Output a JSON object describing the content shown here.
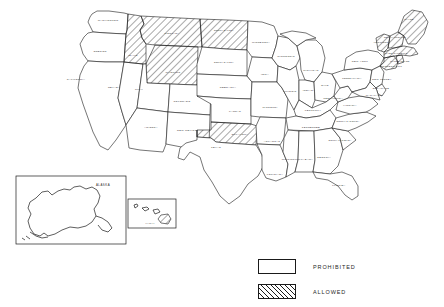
{
  "document": {
    "type": "choropleth-map",
    "region": "United States",
    "rendering": "black-and-white line drawing"
  },
  "legend": {
    "items": [
      {
        "label": "PROHIBITED",
        "pattern": "solid-white",
        "swatch": "prohibited-swatch"
      },
      {
        "label": "ALLOWED",
        "pattern": "diagonal-hatch",
        "swatch": "allowed-swatch"
      }
    ]
  },
  "insets": [
    {
      "name": "ALASKA",
      "label": "ALASKA",
      "status": "prohibited"
    },
    {
      "name": "HAWAII",
      "label": "HAWAII",
      "status": "allowed"
    }
  ],
  "colors": {
    "ink": "#1a1a1a",
    "paper": "#ffffff",
    "label_text": "#2b2b2b"
  },
  "map_data": {
    "type": "choropleth",
    "categories": [
      "PROHIBITED",
      "ALLOWED"
    ],
    "allowed_states": [
      "IDAHO",
      "MONTANA",
      "WYOMING",
      "NORTH DAKOTA",
      "OKLAHOMA",
      "MAINE",
      "NEW HAMPSHIRE",
      "VERMONT",
      "MASSACHUSETTS",
      "CONNECTICUT",
      "RHODE ISLAND",
      "HAWAII"
    ],
    "states": [
      {
        "label": "WASHINGTON",
        "status": "prohibited",
        "lx": 108,
        "ly": 21
      },
      {
        "label": "OREGON",
        "status": "prohibited",
        "lx": 100,
        "ly": 52
      },
      {
        "label": "CALIFORNIA",
        "status": "prohibited",
        "lx": 76,
        "ly": 80
      },
      {
        "label": "NEVADA",
        "status": "prohibited",
        "lx": 114,
        "ly": 88
      },
      {
        "label": "IDAHO",
        "status": "allowed",
        "lx": 133,
        "ly": 56
      },
      {
        "label": "MONTANA",
        "status": "allowed",
        "lx": 172,
        "ly": 34
      },
      {
        "label": "WYOMING",
        "status": "allowed",
        "lx": 173,
        "ly": 73
      },
      {
        "label": "UTAH",
        "status": "prohibited",
        "lx": 139,
        "ly": 90
      },
      {
        "label": "ARIZONA",
        "status": "prohibited",
        "lx": 151,
        "ly": 128
      },
      {
        "label": "COLORADO",
        "status": "prohibited",
        "lx": 182,
        "ly": 102
      },
      {
        "label": "NEW MEXICO",
        "status": "prohibited",
        "lx": 187,
        "ly": 131
      },
      {
        "label": "NORTH DAKOTA",
        "status": "allowed",
        "lx": 224,
        "ly": 31
      },
      {
        "label": "SOUTH DAKOTA",
        "status": "prohibited",
        "lx": 224,
        "ly": 63
      },
      {
        "label": "NEBRASKA",
        "status": "prohibited",
        "lx": 228,
        "ly": 88
      },
      {
        "label": "KANSAS",
        "status": "prohibited",
        "lx": 235,
        "ly": 112
      },
      {
        "label": "OKLAHOMA",
        "status": "allowed",
        "lx": 240,
        "ly": 135
      },
      {
        "label": "TEXAS",
        "status": "prohibited",
        "lx": 216,
        "ly": 148
      },
      {
        "label": "MINNESOTA",
        "status": "prohibited",
        "lx": 261,
        "ly": 43
      },
      {
        "label": "IOWA",
        "status": "prohibited",
        "lx": 265,
        "ly": 75
      },
      {
        "label": "MISSOURI",
        "status": "prohibited",
        "lx": 270,
        "ly": 108
      },
      {
        "label": "ARKANSAS",
        "status": "prohibited",
        "lx": 272,
        "ly": 142
      },
      {
        "label": "LOUISIANA",
        "status": "prohibited",
        "lx": 275,
        "ly": 175
      },
      {
        "label": "WISCONSIN",
        "status": "prohibited",
        "lx": 286,
        "ly": 57
      },
      {
        "label": "ILLINOIS",
        "status": "prohibited",
        "lx": 290,
        "ly": 92
      },
      {
        "label": "MICHIGAN",
        "status": "prohibited",
        "lx": 311,
        "ly": 71
      },
      {
        "label": "INDIANA",
        "status": "prohibited",
        "lx": 309,
        "ly": 91
      },
      {
        "label": "OHIO",
        "status": "prohibited",
        "lx": 325,
        "ly": 86
      },
      {
        "label": "KENTUCKY",
        "status": "prohibited",
        "lx": 313,
        "ly": 111
      },
      {
        "label": "TENNESSEE",
        "status": "prohibited",
        "lx": 311,
        "ly": 128
      },
      {
        "label": "MISSISSIPPI",
        "status": "prohibited",
        "lx": 291,
        "ly": 160
      },
      {
        "label": "ALABAMA",
        "status": "prohibited",
        "lx": 306,
        "ly": 160
      },
      {
        "label": "GEORGIA",
        "status": "prohibited",
        "lx": 324,
        "ly": 158
      },
      {
        "label": "FLORIDA",
        "status": "prohibited",
        "lx": 339,
        "ly": 186
      },
      {
        "label": "SOUTH CAROLINA",
        "status": "prohibited",
        "lx": 340,
        "ly": 141
      },
      {
        "label": "NORTH CAROLINA",
        "status": "prohibited",
        "lx": 348,
        "ly": 122
      },
      {
        "label": "VIRGINIA",
        "status": "prohibited",
        "lx": 350,
        "ly": 106
      },
      {
        "label": "WEST VIRGINIA",
        "status": "prohibited",
        "lx": 333,
        "ly": 99
      },
      {
        "label": "PENNSYLVANIA",
        "status": "prohibited",
        "lx": 352,
        "ly": 79
      },
      {
        "label": "NEW YORK",
        "status": "prohibited",
        "lx": 360,
        "ly": 62
      },
      {
        "label": "MARYLAND",
        "status": "prohibited",
        "lx": 374,
        "ly": 96
      },
      {
        "label": "DELAWARE",
        "status": "prohibited",
        "lx": 381,
        "ly": 89
      },
      {
        "label": "NEW JERSEY",
        "status": "prohibited",
        "lx": 382,
        "ly": 80
      },
      {
        "label": "CONNECTICUT",
        "status": "allowed",
        "lx": 391,
        "ly": 67
      },
      {
        "label": "RHODE ISLAND",
        "status": "allowed",
        "lx": 400,
        "ly": 62
      },
      {
        "label": "MASSACHUSETTS",
        "status": "allowed",
        "lx": 396,
        "ly": 54
      },
      {
        "label": "VERMONT",
        "status": "allowed",
        "lx": 381,
        "ly": 43
      },
      {
        "label": "NEW HAMPSHIRE",
        "status": "allowed",
        "lx": 395,
        "ly": 38
      },
      {
        "label": "MAINE",
        "status": "allowed",
        "lx": 409,
        "ly": 20
      }
    ]
  }
}
